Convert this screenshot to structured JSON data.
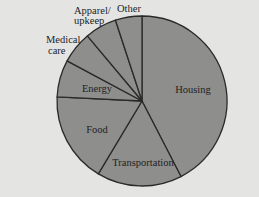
{
  "chart_data": {
    "type": "pie",
    "title": "",
    "start_angle_deg": 0,
    "direction": "clockwise",
    "categories": [
      "Housing",
      "Transportation",
      "Food",
      "Energy",
      "Medical care",
      "Apparel/ upkeep",
      "Other"
    ],
    "values": [
      42,
      16,
      17,
      7,
      6,
      6,
      5
    ],
    "unit": "percent (estimated from slice angles)",
    "legend": "none (labels on/near slices)",
    "colors": {
      "fill": "#8e8e8c",
      "stroke": "#2a2a2a",
      "background": "#e4e4e2"
    }
  },
  "labels": {
    "housing": "Housing",
    "transportation": "Transportation",
    "food": "Food",
    "energy": "Energy",
    "medical_line1": "Medical",
    "medical_line2": "care",
    "apparel_line1": "Apparel/",
    "apparel_line2": "upkeep",
    "other": "Other"
  }
}
